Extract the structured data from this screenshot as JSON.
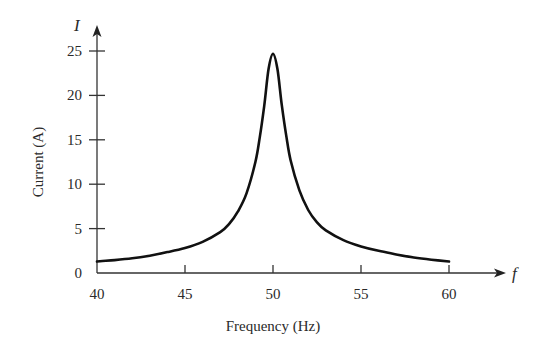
{
  "chart_data": {
    "type": "line",
    "title": "",
    "xlabel": "Frequency (Hz)",
    "ylabel": "Current (A)",
    "x_axis_symbol": "f",
    "y_axis_symbol": "I",
    "xlim": [
      40,
      60
    ],
    "ylim": [
      0,
      25
    ],
    "x_ticks": [
      40,
      45,
      50,
      55,
      60
    ],
    "y_ticks": [
      0,
      5,
      10,
      15,
      20,
      25
    ],
    "grid": false,
    "legend": null,
    "series": [
      {
        "name": "Current",
        "x": [
          40,
          41,
          42,
          43,
          44,
          45,
          46,
          47,
          47.5,
          48,
          48.5,
          49,
          49.25,
          49.5,
          49.75,
          50,
          50.25,
          50.5,
          50.75,
          51,
          51.5,
          52,
          52.5,
          53,
          54,
          55,
          56,
          57,
          58,
          59,
          60
        ],
        "y": [
          1.3,
          1.45,
          1.65,
          1.95,
          2.35,
          2.8,
          3.5,
          4.6,
          5.5,
          6.9,
          9.0,
          12.5,
          15.3,
          18.8,
          23.0,
          24.7,
          23.0,
          18.9,
          15.5,
          12.7,
          9.3,
          7.1,
          5.7,
          4.8,
          3.7,
          3.0,
          2.5,
          2.1,
          1.75,
          1.5,
          1.3
        ]
      }
    ],
    "colors": {
      "line": "#111111",
      "axis": "#333333",
      "text": "#2a2a2a"
    }
  }
}
